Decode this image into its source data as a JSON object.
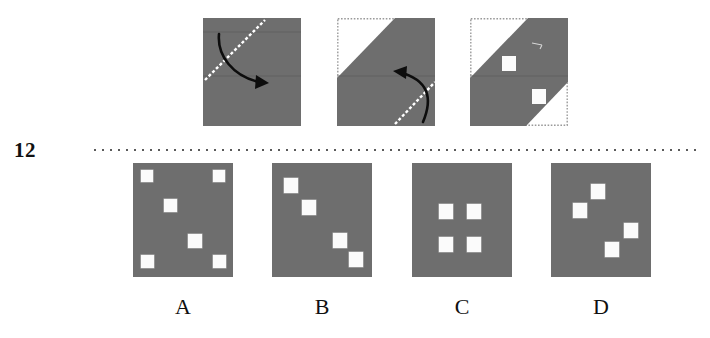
{
  "question": {
    "number": "12",
    "type": "paper-folding"
  },
  "colors": {
    "paper_gray": "#6e6e6e",
    "hole_white": "#fbfbfb",
    "fold_line": "#ffffff",
    "outline_dotted": "#9a9a9a",
    "arrow_black": "#0d0d0d",
    "separator": "#5a5a5a",
    "background": "#ffffff"
  },
  "separator": {
    "name": "dotted-divider",
    "style": "dotted"
  },
  "fold_sequence": {
    "caption": "",
    "panels": [
      {
        "id": "fold-step-1",
        "label": "",
        "shape": "full-square",
        "fold_line": "diagonal-lower-left-to-upper-right",
        "arrow": "curved-arrow-right",
        "holes": []
      },
      {
        "id": "fold-step-2",
        "label": "",
        "shape": "upper-left-corner-folded",
        "fold_line": "diagonal-lower-right",
        "arrow": "curved-arrow-left",
        "holes": []
      },
      {
        "id": "fold-step-3",
        "label": "",
        "shape": "double-folded",
        "fold_line": "none",
        "arrow": "none",
        "holes": [
          {
            "x": 32,
            "y": 38,
            "w": 14,
            "h": 15
          },
          {
            "x": 62,
            "y": 71,
            "w": 14,
            "h": 15
          }
        ]
      }
    ]
  },
  "options": [
    {
      "id": "option-a",
      "label": "A",
      "hole_count": 6,
      "holes": [
        {
          "x": 8,
          "y": 7,
          "w": 12,
          "h": 12
        },
        {
          "x": 80,
          "y": 7,
          "w": 12,
          "h": 12
        },
        {
          "x": 31,
          "y": 36,
          "w": 13,
          "h": 13
        },
        {
          "x": 55,
          "y": 71,
          "w": 14,
          "h": 14
        },
        {
          "x": 8,
          "y": 92,
          "w": 13,
          "h": 13
        },
        {
          "x": 80,
          "y": 92,
          "w": 13,
          "h": 13
        }
      ]
    },
    {
      "id": "option-b",
      "label": "B",
      "hole_count": 4,
      "holes": [
        {
          "x": 12,
          "y": 15,
          "w": 14,
          "h": 15
        },
        {
          "x": 30,
          "y": 37,
          "w": 14,
          "h": 15
        },
        {
          "x": 61,
          "y": 70,
          "w": 14,
          "h": 15
        },
        {
          "x": 77,
          "y": 89,
          "w": 14,
          "h": 15
        }
      ]
    },
    {
      "id": "option-c",
      "label": "C",
      "hole_count": 4,
      "holes": [
        {
          "x": 27,
          "y": 41,
          "w": 14,
          "h": 15
        },
        {
          "x": 55,
          "y": 41,
          "w": 14,
          "h": 15
        },
        {
          "x": 27,
          "y": 74,
          "w": 14,
          "h": 15
        },
        {
          "x": 55,
          "y": 74,
          "w": 14,
          "h": 15
        }
      ]
    },
    {
      "id": "option-d",
      "label": "D",
      "hole_count": 4,
      "holes": [
        {
          "x": 40,
          "y": 21,
          "w": 14,
          "h": 15
        },
        {
          "x": 22,
          "y": 40,
          "w": 14,
          "h": 15
        },
        {
          "x": 73,
          "y": 60,
          "w": 14,
          "h": 15
        },
        {
          "x": 54,
          "y": 79,
          "w": 14,
          "h": 15
        }
      ]
    }
  ],
  "geometry": {
    "panel_left": [
      203,
      337,
      470
    ],
    "panel_top": 18,
    "panel_width": 98,
    "panel_height": 108,
    "option_left": [
      133,
      272,
      412,
      551
    ],
    "option_top": 163,
    "option_width": 100,
    "option_height": 114
  }
}
